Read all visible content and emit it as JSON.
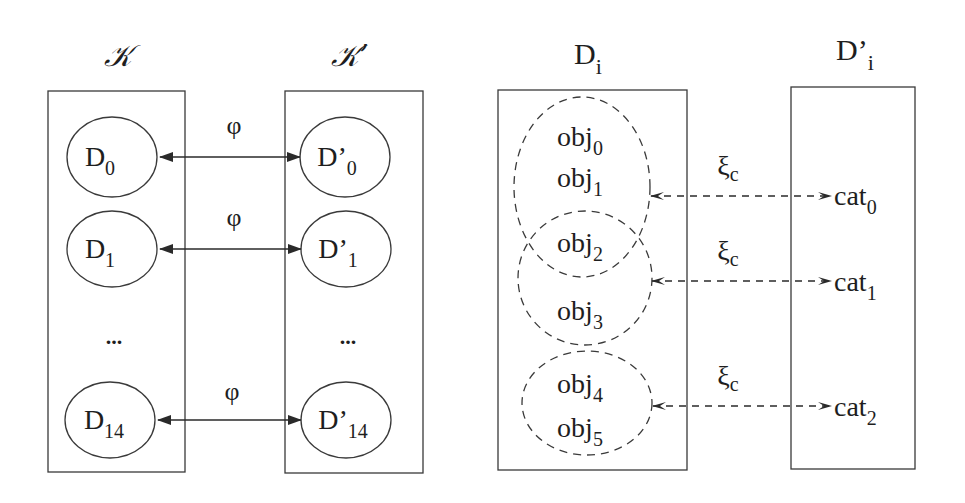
{
  "colors": {
    "stroke": "#3a3a3a",
    "text": "#1e1e1e",
    "background": "#ffffff"
  },
  "left_panel": {
    "set_k": {
      "label": "𝒦",
      "items": [
        {
          "base": "D",
          "sub": "0"
        },
        {
          "base": "D",
          "sub": "1"
        },
        {
          "ellipsis": "..."
        },
        {
          "base": "D",
          "sub": "14"
        }
      ]
    },
    "set_k_prime": {
      "label": "𝒦’",
      "items": [
        {
          "base": "D’",
          "sub": "0"
        },
        {
          "base": "D’",
          "sub": "1"
        },
        {
          "ellipsis": "..."
        },
        {
          "base": "D’",
          "sub": "14"
        }
      ]
    },
    "mappings": [
      {
        "label": "φ",
        "from": "D0",
        "to": "D'0"
      },
      {
        "label": "φ",
        "from": "D1",
        "to": "D'1"
      },
      {
        "label": "φ",
        "from": "D14",
        "to": "D'14"
      }
    ]
  },
  "right_panel": {
    "d_i": {
      "label_base": "D",
      "label_sub": "i",
      "objects": [
        {
          "base": "obj",
          "sub": "0"
        },
        {
          "base": "obj",
          "sub": "1"
        },
        {
          "base": "obj",
          "sub": "2"
        },
        {
          "base": "obj",
          "sub": "3"
        },
        {
          "base": "obj",
          "sub": "4"
        },
        {
          "base": "obj",
          "sub": "5"
        }
      ],
      "groups": [
        {
          "members": [
            "obj0",
            "obj1",
            "obj2"
          ]
        },
        {
          "members": [
            "obj2",
            "obj3"
          ]
        },
        {
          "members": [
            "obj4",
            "obj5"
          ]
        }
      ]
    },
    "d_i_prime": {
      "label_base": "D’",
      "label_sub": "i",
      "categories": [
        {
          "base": "cat",
          "sub": "0"
        },
        {
          "base": "cat",
          "sub": "1"
        },
        {
          "base": "cat",
          "sub": "2"
        }
      ]
    },
    "mappings": [
      {
        "label_base": "ξ",
        "label_sub": "c",
        "from": "group0",
        "to": "cat0"
      },
      {
        "label_base": "ξ",
        "label_sub": "c",
        "from": "group1",
        "to": "cat1"
      },
      {
        "label_base": "ξ",
        "label_sub": "c",
        "from": "group2",
        "to": "cat2"
      }
    ]
  }
}
